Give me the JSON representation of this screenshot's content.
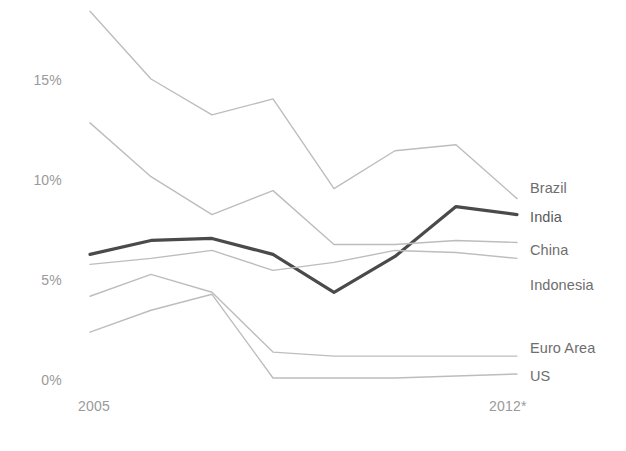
{
  "chart_data": {
    "type": "line",
    "title": "",
    "subtitle": "",
    "xlabel": "",
    "ylabel": "",
    "x": [
      2005,
      2006,
      2007,
      2008,
      2009,
      2010,
      2011,
      2012
    ],
    "xtick_labels": [
      "2005",
      "2012*"
    ],
    "xtick_positions": [
      2005,
      2012
    ],
    "ytick_labels": [
      "15%",
      "10%",
      "5%",
      "0%"
    ],
    "ytick_values": [
      15,
      10,
      5,
      0
    ],
    "ylim": [
      -0.6,
      18.6
    ],
    "xlim": [
      2005,
      2012
    ],
    "grid": false,
    "legend_position": "right-inline",
    "footnote": "*",
    "series": [
      {
        "name": "Brazil",
        "color": "#bdbdbd",
        "width": 1.4,
        "highlight": false,
        "values": [
          18.5,
          15.1,
          13.3,
          14.1,
          9.6,
          11.5,
          11.8,
          9.1
        ]
      },
      {
        "name": "India",
        "color": "#4a4a4a",
        "width": 3.2,
        "highlight": true,
        "values": [
          6.3,
          7.0,
          7.1,
          6.3,
          4.4,
          6.2,
          8.7,
          8.3
        ]
      },
      {
        "name": "China",
        "color": "#bdbdbd",
        "width": 1.4,
        "highlight": false,
        "values": [
          12.9,
          10.2,
          8.3,
          9.5,
          6.8,
          6.8,
          7.0,
          6.9
        ]
      },
      {
        "name": "Indonesia",
        "color": "#bdbdbd",
        "width": 1.4,
        "highlight": false,
        "values": [
          5.8,
          6.1,
          6.5,
          5.5,
          5.9,
          6.5,
          6.4,
          6.1
        ]
      },
      {
        "name": "Euro Area",
        "color": "#bdbdbd",
        "width": 1.4,
        "highlight": false,
        "values": [
          4.2,
          5.3,
          4.4,
          1.4,
          1.2,
          1.2,
          1.2,
          1.2
        ]
      },
      {
        "name": "US",
        "color": "#bdbdbd",
        "width": 1.4,
        "highlight": false,
        "values": [
          2.4,
          3.5,
          4.3,
          0.1,
          0.1,
          0.1,
          0.2,
          0.3
        ]
      }
    ]
  },
  "labels": {
    "brazil": "Brazil",
    "india": "India",
    "china": "China",
    "indonesia": "Indonesia",
    "euro_area": "Euro Area",
    "us": "US",
    "y0": "0%",
    "y5": "5%",
    "y10": "10%",
    "y15": "15%",
    "x_start": "2005",
    "x_end": "2012*"
  }
}
